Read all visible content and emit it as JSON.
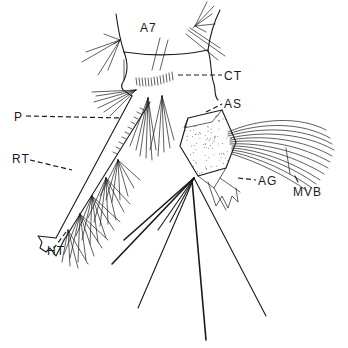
{
  "figure": {
    "colors": {
      "ink": "#1a1a1a",
      "background": "#ffffff"
    },
    "labels": [
      {
        "id": "A7",
        "text": "A7"
      },
      {
        "id": "CT",
        "text": "CT"
      },
      {
        "id": "P",
        "text": "P"
      },
      {
        "id": "AS",
        "text": "AS"
      },
      {
        "id": "RT",
        "text": "RT"
      },
      {
        "id": "AG",
        "text": "AG"
      },
      {
        "id": "MVB",
        "text": "MVB"
      },
      {
        "id": "HT",
        "text": "HT"
      }
    ]
  }
}
